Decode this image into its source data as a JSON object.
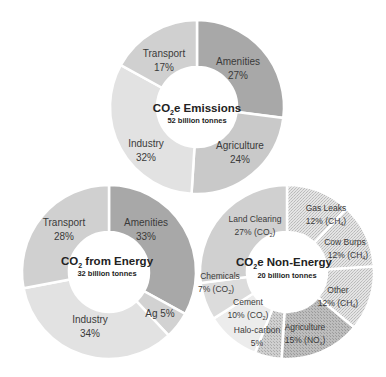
{
  "chart_data": [
    {
      "type": "pie",
      "variant": "donut",
      "title": "CO2e Emissions",
      "subtitle": "52 billion tonnes",
      "center": [
        197,
        107
      ],
      "r_outer": 87,
      "r_inner": 40,
      "slices": [
        {
          "label": "Amenities",
          "value": 27,
          "value_text": "27%",
          "color": "#a8a8a8",
          "pattern": "solid"
        },
        {
          "label": "Agriculture",
          "value": 24,
          "value_text": "24%",
          "color": "#c9c9c9",
          "pattern": "solid"
        },
        {
          "label": "Industry",
          "value": 32,
          "value_text": "32%",
          "color": "#e2e2e2",
          "pattern": "solid"
        },
        {
          "label": "Transport",
          "value": 17,
          "value_text": "17%",
          "color": "#d0d0d0",
          "pattern": "solid"
        }
      ]
    },
    {
      "type": "pie",
      "variant": "donut",
      "title": "CO2 from Energy",
      "subtitle": "32 billion tonnes",
      "center": [
        109,
        272
      ],
      "r_outer": 87,
      "r_inner": 40,
      "slices": [
        {
          "label": "Amenities",
          "value": 33,
          "value_text": "33%",
          "color": "#a8a8a8",
          "pattern": "solid"
        },
        {
          "label": "Ag",
          "value": 5,
          "value_text": "5%",
          "color": "#d2d2d2",
          "pattern": "solid"
        },
        {
          "label": "Industry",
          "value": 34,
          "value_text": "34%",
          "color": "#e2e2e2",
          "pattern": "solid"
        },
        {
          "label": "Transport",
          "value": 28,
          "value_text": "28%",
          "color": "#d0d0d0",
          "pattern": "solid"
        }
      ]
    },
    {
      "type": "pie",
      "variant": "donut",
      "title": "CO2e Non-Energy",
      "subtitle": "20 billion tonnes",
      "center": [
        287,
        272
      ],
      "r_outer": 87,
      "r_inner": 40,
      "slices": [
        {
          "label": "Gas Leaks",
          "value": 12,
          "value_text": "12% (CH4)",
          "gas": "CH4",
          "color": "#d6d6d6",
          "pattern": "hatch"
        },
        {
          "label": "Cow Burps",
          "value": 12,
          "value_text": "12% (CH4)",
          "gas": "CH4",
          "color": "#d6d6d6",
          "pattern": "hatch"
        },
        {
          "label": "Other",
          "value": 12,
          "value_text": "12% (CH4)",
          "gas": "CH4",
          "color": "#d6d6d6",
          "pattern": "hatch"
        },
        {
          "label": "Agriculture",
          "value": 15,
          "value_text": "15% (NOx)",
          "gas": "NOx",
          "color": "#b4b4b4",
          "pattern": "stipple"
        },
        {
          "label": "Halo-carbon",
          "value": 5,
          "value_text": "5%",
          "color": "#c4c4c4",
          "pattern": "stipple"
        },
        {
          "label": "Cement",
          "value": 10,
          "value_text": "10% (CO2)",
          "gas": "CO2",
          "color": "#ececec",
          "pattern": "solid"
        },
        {
          "label": "Chemicals",
          "value": 7,
          "value_text": "7% (CO2)",
          "gas": "CO2",
          "color": "#dcdcdc",
          "pattern": "solid"
        },
        {
          "label": "Land Clearing",
          "value": 27,
          "value_text": "27% (CO2)",
          "gas": "CO2",
          "color": "#d0d0d0",
          "pattern": "solid"
        }
      ]
    }
  ],
  "charts": {
    "total": {
      "title_pre": "CO",
      "title_sub": "2",
      "title_post": "e Emissions",
      "subtitle": "52 billion tonnes",
      "labels": [
        {
          "name": "Amenities",
          "pct": "27%"
        },
        {
          "name": "Agriculture",
          "pct": "24%"
        },
        {
          "name": "Industry",
          "pct": "32%"
        },
        {
          "name": "Transport",
          "pct": "17%"
        }
      ]
    },
    "energy": {
      "title_pre": "CO",
      "title_sub": "2",
      "title_post": " from Energy",
      "subtitle": "32 billion tonnes",
      "labels": [
        {
          "name": "Amenities",
          "pct": "33%"
        },
        {
          "name": "Ag 5%"
        },
        {
          "name": "Industry",
          "pct": "34%"
        },
        {
          "name": "Transport",
          "pct": "28%"
        }
      ]
    },
    "nonenergy": {
      "title_pre": "CO",
      "title_sub": "2",
      "title_post": "e Non-Energy",
      "subtitle": "20 billion tonnes",
      "labels": [
        {
          "name": "Gas Leaks",
          "pct": "12% (CH",
          "sub": "4",
          "close": ")"
        },
        {
          "name": "Cow Burps",
          "pct": "12% (CH",
          "sub": "4",
          "close": ")"
        },
        {
          "name": "Other",
          "pct": "12% (CH",
          "sub": "4",
          "close": ")"
        },
        {
          "name": "Agriculture",
          "pct": "15% (NO",
          "sub": "x",
          "close": ")"
        },
        {
          "name": "Halo-carbon",
          "pct": "5%"
        },
        {
          "name": "Cement",
          "pct": "10% (CO",
          "sub": "2",
          "close": ")"
        },
        {
          "name": "Chemicals",
          "pct": "7% (CO",
          "sub": "2",
          "close": ")"
        },
        {
          "name": "Land Clearing",
          "pct": "27% (CO",
          "sub": "2",
          "close": ")"
        }
      ]
    }
  }
}
